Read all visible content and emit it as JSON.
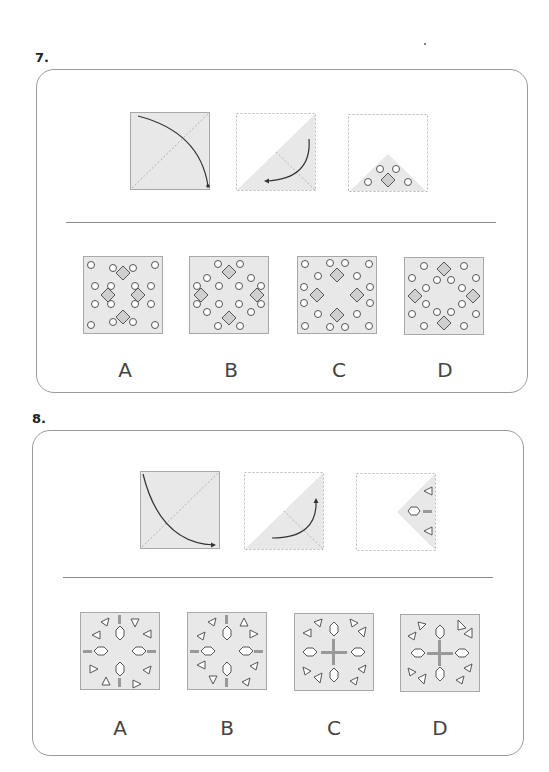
{
  "colors": {
    "panel_fill": "#e8e8e8",
    "panel_border": "#a8a8a8",
    "diamond_fill": "#cfcfcf",
    "stroke": "#555555",
    "arrow": "#333333"
  },
  "questions": [
    {
      "number": "7.",
      "prompt_panels": [
        {
          "kind": "fold-diagonal",
          "description": "square with arc arrow from top-left to bottom-right (fold along diagonal)"
        },
        {
          "kind": "fold-triangle",
          "description": "lower-right triangle folded again, curved arrow pointing to bottom-left"
        },
        {
          "kind": "cut-pattern",
          "description": "small triangle at bottom with 4 circles and 1 diamond"
        }
      ],
      "options": [
        {
          "label": "A"
        },
        {
          "label": "B"
        },
        {
          "label": "C"
        },
        {
          "label": "D"
        }
      ]
    },
    {
      "number": "8.",
      "prompt_panels": [
        {
          "kind": "fold-diagonal",
          "description": "square with arc arrow from top-left to bottom-right"
        },
        {
          "kind": "fold-triangle",
          "description": "lower-right triangle folded, curved arrow pointing up"
        },
        {
          "kind": "cut-pattern",
          "description": "right triangle with 2 small triangles, hexagon and bar"
        }
      ],
      "options": [
        {
          "label": "A"
        },
        {
          "label": "B"
        },
        {
          "label": "C"
        },
        {
          "label": "D"
        }
      ]
    }
  ]
}
